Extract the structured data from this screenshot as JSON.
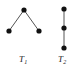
{
  "figure": {
    "width": 76,
    "height": 73,
    "background_color": "#ffffff",
    "vertex_color": "#111111",
    "edge_color": "#555555",
    "label_color": "#1a1a1a"
  },
  "graphs": [
    {
      "id": "T1",
      "label_base": "T",
      "label_subscript": "1",
      "description": "path on three vertices drawn as an inverted V with apex at top",
      "vertices": [
        {
          "name": "apex",
          "x": 24,
          "y": 10,
          "r": 2.6
        },
        {
          "name": "left-leaf",
          "x": 9,
          "y": 31,
          "r": 2.6
        },
        {
          "name": "right-leaf",
          "x": 39,
          "y": 31,
          "r": 2.6
        }
      ],
      "edges": [
        {
          "from": "apex",
          "to": "left-leaf"
        },
        {
          "from": "apex",
          "to": "right-leaf"
        }
      ]
    },
    {
      "id": "T2",
      "label_base": "T",
      "label_subscript": "2",
      "description": "path on three collinear vertices drawn vertically",
      "vertices": [
        {
          "name": "top",
          "x": 64,
          "y": 9,
          "r": 2.6
        },
        {
          "name": "middle",
          "x": 64,
          "y": 28,
          "r": 2.6
        },
        {
          "name": "bottom",
          "x": 64,
          "y": 48,
          "r": 2.6
        }
      ],
      "edges": [
        {
          "from": "top",
          "to": "middle"
        },
        {
          "from": "middle",
          "to": "bottom"
        }
      ]
    }
  ]
}
